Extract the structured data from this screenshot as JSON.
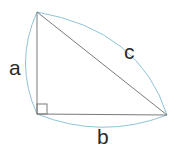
{
  "diagram": {
    "labels": {
      "a": "a",
      "b": "b",
      "c": "c"
    },
    "colors": {
      "triangle": "#7a7a7a",
      "arc": "#8fc4d8",
      "label": "#2a2a2a"
    },
    "vertices": {
      "top": [
        37,
        12
      ],
      "right_angle": [
        37,
        114
      ],
      "right": [
        167,
        115
      ]
    }
  }
}
